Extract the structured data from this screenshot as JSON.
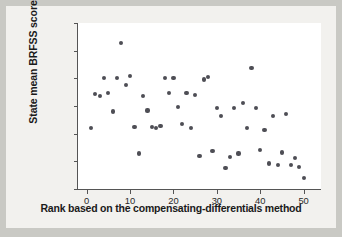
{
  "chart_data": {
    "type": "scatter",
    "title": "",
    "xlabel": "Rank based on the compensating-differentials method",
    "ylabel": "State mean BRFSS score",
    "xlim": [
      -2,
      54
    ],
    "ylim": [
      -0.1,
      0.05
    ],
    "xticks": [
      "0",
      "10",
      "20",
      "30",
      "40",
      "50"
    ],
    "xtick_values": [
      0,
      10,
      20,
      30,
      40,
      50
    ],
    "yticks": [
      "0.050",
      "0.025",
      "0.000",
      "-0.025",
      "-0.050",
      "-0.075",
      "-0.100"
    ],
    "ytick_values": [
      0.05,
      0.025,
      0.0,
      -0.025,
      -0.05,
      -0.075,
      -0.1
    ],
    "grid": false,
    "legend": false,
    "marker_color": "#4e4e55",
    "axis_color": "#555555",
    "plot_background": "#ffffff",
    "figure_background": "#f2f1ee",
    "points": [
      {
        "x": 1,
        "y": -0.045
      },
      {
        "x": 2,
        "y": -0.014
      },
      {
        "x": 3,
        "y": -0.016
      },
      {
        "x": 4,
        "y": 0.0
      },
      {
        "x": 5,
        "y": -0.013
      },
      {
        "x": 6,
        "y": -0.03
      },
      {
        "x": 7,
        "y": 0.0
      },
      {
        "x": 8,
        "y": 0.032
      },
      {
        "x": 9,
        "y": -0.006
      },
      {
        "x": 10,
        "y": 0.002
      },
      {
        "x": 11,
        "y": -0.044
      },
      {
        "x": 12,
        "y": -0.068
      },
      {
        "x": 13,
        "y": -0.016
      },
      {
        "x": 14,
        "y": -0.029
      },
      {
        "x": 15,
        "y": -0.044
      },
      {
        "x": 16,
        "y": -0.045
      },
      {
        "x": 17,
        "y": -0.043
      },
      {
        "x": 18,
        "y": 0.0
      },
      {
        "x": 19,
        "y": -0.013
      },
      {
        "x": 20,
        "y": 0.0
      },
      {
        "x": 21,
        "y": -0.026
      },
      {
        "x": 22,
        "y": -0.041
      },
      {
        "x": 23,
        "y": -0.013
      },
      {
        "x": 24,
        "y": -0.045
      },
      {
        "x": 25,
        "y": -0.015
      },
      {
        "x": 26,
        "y": -0.07
      },
      {
        "x": 27,
        "y": -0.001
      },
      {
        "x": 28,
        "y": 0.001
      },
      {
        "x": 29,
        "y": -0.066
      },
      {
        "x": 30,
        "y": -0.027
      },
      {
        "x": 31,
        "y": -0.034
      },
      {
        "x": 32,
        "y": -0.081
      },
      {
        "x": 33,
        "y": -0.071
      },
      {
        "x": 34,
        "y": -0.027
      },
      {
        "x": 35,
        "y": -0.068
      },
      {
        "x": 36,
        "y": -0.022
      },
      {
        "x": 37,
        "y": -0.045
      },
      {
        "x": 38,
        "y": 0.009
      },
      {
        "x": 39,
        "y": -0.027
      },
      {
        "x": 40,
        "y": -0.065
      },
      {
        "x": 41,
        "y": -0.047
      },
      {
        "x": 42,
        "y": -0.077
      },
      {
        "x": 43,
        "y": -0.034
      },
      {
        "x": 44,
        "y": -0.078
      },
      {
        "x": 45,
        "y": -0.067
      },
      {
        "x": 46,
        "y": -0.032
      },
      {
        "x": 47,
        "y": -0.078
      },
      {
        "x": 48,
        "y": -0.072
      },
      {
        "x": 49,
        "y": -0.08
      },
      {
        "x": 50,
        "y": -0.09
      }
    ]
  }
}
